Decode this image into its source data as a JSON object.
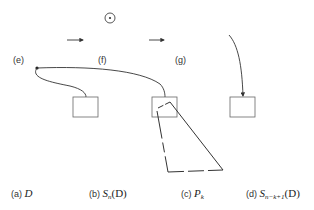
{
  "panel_labels": {
    "e": "(e)",
    "f": "(f)",
    "g": "(g)"
  },
  "captions": [
    {
      "id": "a",
      "prefix": "(a)",
      "math": "D",
      "sub": "",
      "suffix": ""
    },
    {
      "id": "b",
      "prefix": "(b)",
      "math": "S",
      "sub": "n",
      "suffix": "(D)"
    },
    {
      "id": "c",
      "prefix": "(c)",
      "math": "P",
      "sub": "k",
      "suffix": ""
    },
    {
      "id": "d",
      "prefix": "(d)",
      "math": "S",
      "sub": "n−k+1",
      "suffix": "(D)"
    }
  ],
  "colors": {
    "stroke": "#333333",
    "box_stroke": "#555555",
    "background": "#ffffff"
  }
}
